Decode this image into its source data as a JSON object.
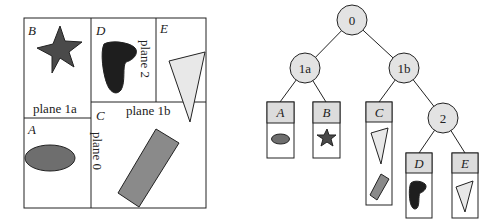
{
  "colors": {
    "line": "#222222",
    "node_fill": "#e3e3e3",
    "header_fill": "#dcdcdc",
    "mid_gray": "#6e6e6e",
    "dark_gray": "#4a4a4a",
    "black_blob": "#1e1e1e",
    "light_fill": "#e8e8e8"
  },
  "partition": {
    "regions": {
      "A": "A",
      "B": "B",
      "C": "C",
      "D": "D",
      "E": "E"
    },
    "planes": {
      "plane_1a": "plane 1a",
      "plane_1b": "plane 1b",
      "plane_0": "plane 0",
      "plane_2": "plane 2"
    }
  },
  "tree": {
    "nodes": {
      "root": "0",
      "n1a": "1a",
      "n1b": "1b",
      "n2": "2"
    },
    "leaves": {
      "A": "A",
      "B": "B",
      "C": "C",
      "D": "D",
      "E": "E"
    }
  }
}
